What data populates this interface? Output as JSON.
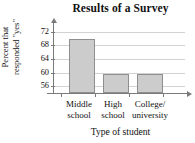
{
  "chart_data": {
    "type": "bar",
    "title": "Results of a Survey",
    "xlabel": "Type of student",
    "ylabel": "Percent that responded \"yes\"",
    "ylabel_line1": "Percent that",
    "ylabel_line2": "responded \"yes\"",
    "categories": [
      "Middle school",
      "High school",
      "College/ university"
    ],
    "category_lines": [
      {
        "line1": "Middle",
        "line2": "school"
      },
      {
        "line1": "High",
        "line2": "school"
      },
      {
        "line1": "College/",
        "line2": "university"
      }
    ],
    "values": [
      70,
      59.5,
      59.5
    ],
    "ytick_labels": [
      "72",
      "68",
      "64",
      "60",
      "56"
    ],
    "ytick_values": [
      72,
      68,
      64,
      60,
      56
    ],
    "ylim": [
      54,
      74
    ],
    "grid": true,
    "legend": "none",
    "bar_fill_color": "#cccccc",
    "bar_border_color": "#8f8f8f",
    "axis_color": "#7a7a7a",
    "gridline_color": "#d2d2d2",
    "text_color": "#111111",
    "background_color": "#ffffff"
  }
}
